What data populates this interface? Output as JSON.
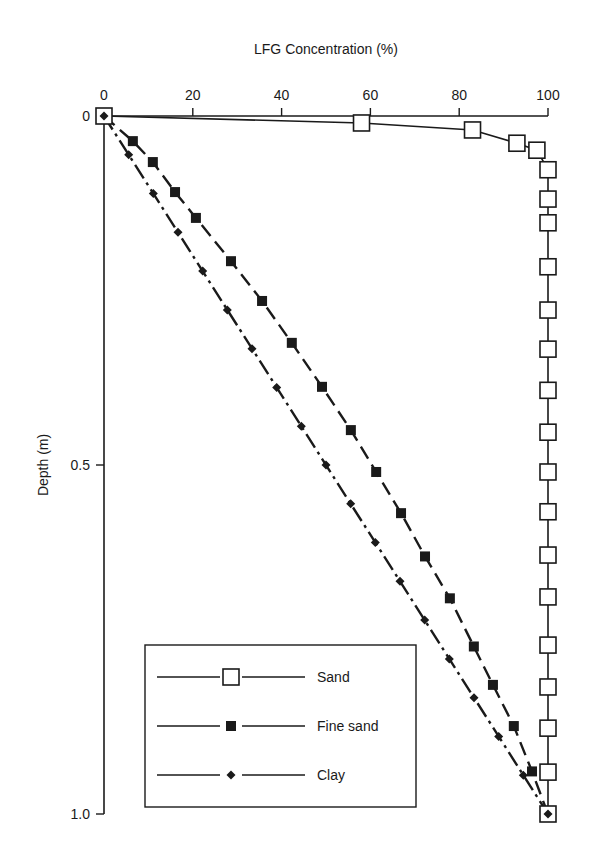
{
  "chart_data": {
    "type": "line",
    "title": "",
    "xlabel": "LFG Concentration (%)",
    "ylabel": "Depth (m)",
    "x_axis_position": "top",
    "y_axis_inverted": true,
    "xlim": [
      0,
      100
    ],
    "ylim": [
      0,
      1.0
    ],
    "x_ticks": [
      0,
      20,
      40,
      60,
      80,
      100
    ],
    "x_tick_labels": [
      "0",
      "20",
      "40",
      "60",
      "80",
      "100"
    ],
    "y_ticks": [
      0,
      0.5,
      1.0
    ],
    "y_tick_labels": [
      "0",
      "0.5",
      "1.0"
    ],
    "grid": false,
    "legend_position": "lower-left inside",
    "series": [
      {
        "name": "Sand",
        "marker": "open-square",
        "line": "solid",
        "points": [
          {
            "x": 0,
            "y": 0
          },
          {
            "x": 58,
            "y": 0.01
          },
          {
            "x": 83,
            "y": 0.02
          },
          {
            "x": 93,
            "y": 0.039
          },
          {
            "x": 97.5,
            "y": 0.049
          },
          {
            "x": 100,
            "y": 0.077
          },
          {
            "x": 100,
            "y": 0.119
          },
          {
            "x": 100,
            "y": 0.153
          },
          {
            "x": 100,
            "y": 0.216
          },
          {
            "x": 100,
            "y": 0.278
          },
          {
            "x": 100,
            "y": 0.334
          },
          {
            "x": 100,
            "y": 0.393
          },
          {
            "x": 100,
            "y": 0.453
          },
          {
            "x": 100,
            "y": 0.51
          },
          {
            "x": 100,
            "y": 0.567
          },
          {
            "x": 100,
            "y": 0.629
          },
          {
            "x": 100,
            "y": 0.689
          },
          {
            "x": 100,
            "y": 0.758
          },
          {
            "x": 100,
            "y": 0.818
          },
          {
            "x": 100,
            "y": 0.877
          },
          {
            "x": 100,
            "y": 0.94
          },
          {
            "x": 100,
            "y": 1.0
          }
        ]
      },
      {
        "name": "Fine sand",
        "marker": "filled-square",
        "line": "dashed",
        "points": [
          {
            "x": 0,
            "y": 0
          },
          {
            "x": 6.5,
            "y": 0.036
          },
          {
            "x": 11,
            "y": 0.066
          },
          {
            "x": 16,
            "y": 0.109
          },
          {
            "x": 20.7,
            "y": 0.146
          },
          {
            "x": 28.6,
            "y": 0.208
          },
          {
            "x": 35.6,
            "y": 0.265
          },
          {
            "x": 42.3,
            "y": 0.325
          },
          {
            "x": 49.1,
            "y": 0.388
          },
          {
            "x": 55.6,
            "y": 0.45
          },
          {
            "x": 61.3,
            "y": 0.51
          },
          {
            "x": 66.9,
            "y": 0.569
          },
          {
            "x": 72.3,
            "y": 0.631
          },
          {
            "x": 77.9,
            "y": 0.691
          },
          {
            "x": 83.3,
            "y": 0.76
          },
          {
            "x": 87.6,
            "y": 0.815
          },
          {
            "x": 92.3,
            "y": 0.874
          },
          {
            "x": 96.4,
            "y": 0.939
          },
          {
            "x": 100,
            "y": 1.0
          }
        ]
      },
      {
        "name": "Clay",
        "marker": "filled-diamond",
        "line": "dash-dot",
        "points": [
          {
            "x": 0,
            "y": 0
          },
          {
            "x": 100,
            "y": 1.0
          }
        ]
      }
    ],
    "endpoint_marker": {
      "x": 100,
      "y": 1.0,
      "style": "open-square-with-diamond"
    },
    "origin_marker": {
      "x": 0,
      "y": 0,
      "style": "open-square-with-diamond"
    }
  },
  "legend": {
    "items": [
      {
        "label": "Sand",
        "marker": "open-square"
      },
      {
        "label": "Fine sand",
        "marker": "filled-square"
      },
      {
        "label": "Clay",
        "marker": "filled-diamond"
      }
    ]
  },
  "colors": {
    "ink": "#1a1a1a",
    "background": "#ffffff"
  }
}
